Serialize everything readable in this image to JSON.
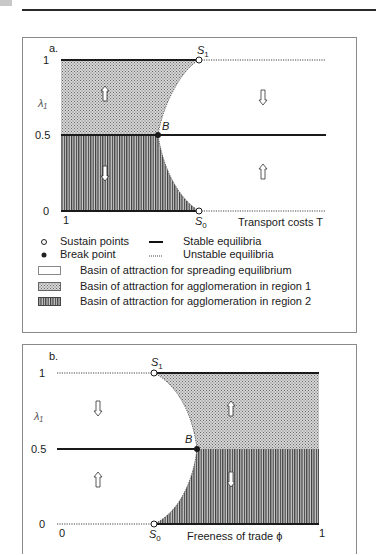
{
  "panel_a": {
    "label": "a.",
    "y_axis_label": "λ₁",
    "y_ticks": [
      "1",
      "0.5",
      "0"
    ],
    "x_ticks": [
      "1"
    ],
    "x_axis_label": "Transport costs T",
    "points": {
      "s1": "S1",
      "s0": "S0",
      "b": "B"
    }
  },
  "panel_b": {
    "label": "b.",
    "y_axis_label": "λ₁",
    "y_ticks": [
      "1",
      "0.5",
      "0"
    ],
    "x_ticks": [
      "0",
      "1"
    ],
    "x_axis_label": "Freeness of trade ϕ",
    "points": {
      "s1": "S1",
      "s0": "S0",
      "b": "B"
    }
  },
  "legend": {
    "sustain_points": "Sustain points",
    "break_point": "Break point",
    "stable_equilibria": "Stable equilibria",
    "unstable_equilibria": "Unstable equilibria",
    "basin_spreading": "Basin of attraction for spreading equilibrium",
    "basin_region1": "Basin of attraction for agglomeration in region 1",
    "basin_region2": "Basin of attraction for agglomeration in region 2"
  },
  "colors": {
    "stable_line": "#1a1a1a",
    "unstable_line": "#444444",
    "region1_fill": "#c9c9c9",
    "region2_fill": "#7a7a7a",
    "spreading_fill": "#ffffff"
  }
}
